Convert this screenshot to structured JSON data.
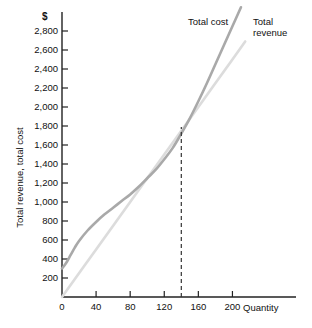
{
  "chart_data": {
    "type": "line",
    "title": "",
    "xlabel": "Quantity",
    "ylabel": "Total revenue, total cost",
    "y_axis_unit_symbol": "$",
    "xlim": [
      0,
      230
    ],
    "ylim": [
      0,
      3000
    ],
    "xticks": [
      0,
      40,
      80,
      120,
      160,
      200
    ],
    "xtick_labels": [
      "0",
      "40",
      "80",
      "120",
      "160",
      "200"
    ],
    "yticks": [
      200,
      400,
      600,
      800,
      1000,
      1200,
      1400,
      1600,
      1800,
      2000,
      2200,
      2400,
      2600,
      2800
    ],
    "ytick_labels": [
      "200",
      "400",
      "600",
      "800",
      "1,000",
      "1,200",
      "1,400",
      "1,600",
      "1,800",
      "2,000",
      "2,200",
      "2,400",
      "2,600",
      "2,800"
    ],
    "grid": false,
    "legend_position": "inline-annotations",
    "series": [
      {
        "name": "Total cost",
        "color": "#a9a9a9",
        "x": [
          0,
          5,
          10,
          15,
          20,
          30,
          40,
          50,
          60,
          70,
          80,
          90,
          100,
          110,
          120,
          130,
          140,
          150,
          160,
          170,
          180,
          190,
          200,
          210
        ],
        "values": [
          300,
          360,
          440,
          520,
          590,
          700,
          790,
          870,
          940,
          1010,
          1080,
          1160,
          1250,
          1340,
          1450,
          1570,
          1720,
          1880,
          2060,
          2250,
          2450,
          2650,
          2850,
          3050
        ]
      },
      {
        "name": "Total revenue",
        "color": "#dcdcdc",
        "x": [
          0,
          40,
          80,
          120,
          160,
          200,
          215
        ],
        "values": [
          0,
          500,
          1000,
          1500,
          2000,
          2500,
          2690
        ]
      }
    ],
    "annotations": [
      {
        "name": "breakeven-marker",
        "type": "vertical-dashed-line",
        "x": 140,
        "y_top": 1790,
        "label": ""
      }
    ]
  },
  "axis": {
    "y_title": "Total revenue, total cost",
    "x_title": "Quantity",
    "currency_symbol": "$"
  },
  "labels": {
    "total_cost": "Total cost",
    "total_revenue_line1": "Total",
    "total_revenue_line2": "revenue"
  },
  "colors": {
    "total_cost": "#a9a9a9",
    "total_revenue": "#dcdcdc",
    "axis": "#222222",
    "dashed_marker": "#333333",
    "text": "#111111"
  }
}
